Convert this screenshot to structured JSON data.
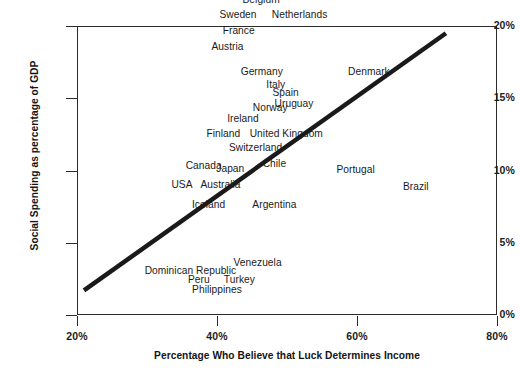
{
  "chart_data": {
    "type": "scatter",
    "title": "",
    "xlabel": "Percentage Who Believe that Luck Determines Income",
    "ylabel": "Social Spending as percentage of GDP",
    "xlim": [
      20,
      80
    ],
    "ylim": [
      0,
      20
    ],
    "xticks": [
      "20%",
      "40%",
      "60%",
      "80%"
    ],
    "yticks": [
      "0%",
      "5%",
      "10%",
      "15%",
      "20%"
    ],
    "grid": false,
    "legend": null,
    "marker_style": "text-labels-only",
    "trendline": {
      "type": "linear",
      "x_start": 21.0,
      "y_start": 1.7,
      "x_end": 72.7,
      "y_end": 19.5,
      "color": "#1a1a1a",
      "width_px": 4.5
    },
    "points": [
      {
        "label": "Belgium",
        "x": 46.3,
        "y": 21.9
      },
      {
        "label": "Sweden",
        "x": 43.0,
        "y": 20.8
      },
      {
        "label": "Netherlands",
        "x": 51.8,
        "y": 20.8
      },
      {
        "label": "France",
        "x": 43.1,
        "y": 19.7
      },
      {
        "label": "Austria",
        "x": 41.5,
        "y": 18.6
      },
      {
        "label": "Germany",
        "x": 46.4,
        "y": 16.9
      },
      {
        "label": "Denmark",
        "x": 61.7,
        "y": 16.9
      },
      {
        "label": "Italy",
        "x": 48.4,
        "y": 16.0
      },
      {
        "label": "Spain",
        "x": 49.8,
        "y": 15.4
      },
      {
        "label": "Uruguay",
        "x": 51.0,
        "y": 14.7
      },
      {
        "label": "Norway",
        "x": 47.6,
        "y": 14.4
      },
      {
        "label": "Ireland",
        "x": 43.7,
        "y": 13.6
      },
      {
        "label": "Finland",
        "x": 40.9,
        "y": 12.6
      },
      {
        "label": "United Kingdom",
        "x": 49.9,
        "y": 12.6
      },
      {
        "label": "Switzerland",
        "x": 45.5,
        "y": 11.6
      },
      {
        "label": "Chile",
        "x": 48.2,
        "y": 10.5
      },
      {
        "label": "Canada",
        "x": 38.1,
        "y": 10.4
      },
      {
        "label": "Japan",
        "x": 41.9,
        "y": 10.2
      },
      {
        "label": "Portugal",
        "x": 59.8,
        "y": 10.1
      },
      {
        "label": "USA",
        "x": 35.0,
        "y": 9.1
      },
      {
        "label": "Australia",
        "x": 40.5,
        "y": 9.1
      },
      {
        "label": "Brazil",
        "x": 68.4,
        "y": 8.9
      },
      {
        "label": "Iceland",
        "x": 38.8,
        "y": 7.7
      },
      {
        "label": "Argentina",
        "x": 48.2,
        "y": 7.7
      },
      {
        "label": "Venezuela",
        "x": 45.8,
        "y": 3.7
      },
      {
        "label": "Dominican Republic",
        "x": 36.2,
        "y": 3.1
      },
      {
        "label": "Peru",
        "x": 37.4,
        "y": 2.5
      },
      {
        "label": "Turkey",
        "x": 43.2,
        "y": 2.5
      },
      {
        "label": "Philippines",
        "x": 40.0,
        "y": 1.8
      }
    ]
  }
}
